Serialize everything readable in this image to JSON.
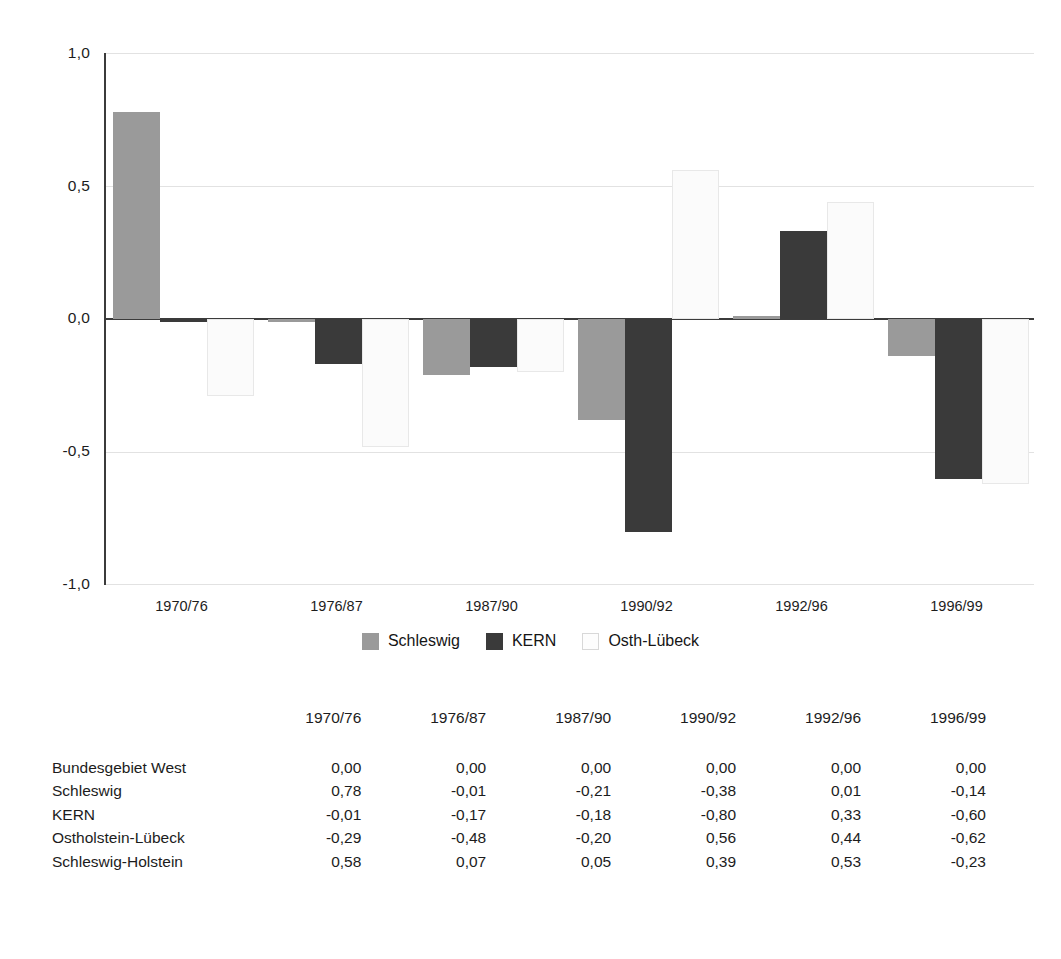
{
  "chart_data": {
    "type": "bar",
    "title": "",
    "subtitle": "",
    "xlabel": "",
    "ylabel": "",
    "categories": [
      "1970/76",
      "1976/87",
      "1987/90",
      "1990/92",
      "1992/96",
      "1996/99"
    ],
    "series": [
      {
        "name": "Schleswig",
        "color": "#9a9a9a",
        "values": [
          0.78,
          -0.01,
          -0.21,
          -0.38,
          0.01,
          -0.14
        ]
      },
      {
        "name": "KERN",
        "color": "#3a3a3a",
        "values": [
          -0.01,
          -0.17,
          -0.18,
          -0.8,
          0.33,
          -0.6
        ]
      },
      {
        "name": "Osth-Lübeck",
        "color": "#fbfbfb",
        "values": [
          -0.29,
          -0.48,
          -0.2,
          0.56,
          0.44,
          -0.62
        ]
      }
    ],
    "ylim": [
      -1.0,
      1.0
    ],
    "yticks": [
      1.0,
      0.5,
      0.0,
      -0.5,
      -1.0
    ],
    "ytick_labels": [
      "1,0",
      "0,5",
      "0,0",
      "-0,5",
      "-1,0"
    ],
    "grid": true,
    "legend_position": "bottom",
    "legend_entries": [
      "Schleswig",
      "KERN",
      "Osth-Lübeck"
    ]
  },
  "legend": {
    "entries": [
      {
        "label": "Schleswig",
        "swatch": "schleswig"
      },
      {
        "label": "KERN",
        "swatch": "kern"
      },
      {
        "label": "Osth-Lübeck",
        "swatch": "osth"
      }
    ]
  },
  "axis": {
    "y_ticks": [
      "1,0",
      "0,5",
      "0,0",
      "-0,5",
      "-1,0"
    ],
    "x_ticks": [
      "1970/76",
      "1976/87",
      "1987/90",
      "1990/92",
      "1992/96",
      "1996/99"
    ]
  },
  "table": {
    "corner_label": "",
    "columns": [
      "1970/76",
      "1976/87",
      "1987/90",
      "1990/92",
      "1992/96",
      "1996/99"
    ],
    "rows": [
      {
        "label": "Bundesgebiet West",
        "values": [
          "0,00",
          "0,00",
          "0,00",
          "0,00",
          "0,00",
          "0,00"
        ]
      },
      {
        "label": "Schleswig",
        "values": [
          "0,78",
          "-0,01",
          "-0,21",
          "-0,38",
          "0,01",
          "-0,14"
        ]
      },
      {
        "label": "KERN",
        "values": [
          "-0,01",
          "-0,17",
          "-0,18",
          "-0,80",
          "0,33",
          "-0,60"
        ]
      },
      {
        "label": "Ostholstein-Lübeck",
        "values": [
          "-0,29",
          "-0,48",
          "-0,20",
          "0,56",
          "0,44",
          "-0,62"
        ]
      },
      {
        "label": "Schleswig-Holstein",
        "values": [
          "0,58",
          "0,07",
          "0,05",
          "0,39",
          "0,53",
          "-0,23"
        ]
      }
    ]
  },
  "colors": {
    "schleswig": "#9a9a9a",
    "kern": "#3a3a3a",
    "osth": "#fbfbfb",
    "axis": "#3b3b3b",
    "grid": "#e2e2e2"
  }
}
